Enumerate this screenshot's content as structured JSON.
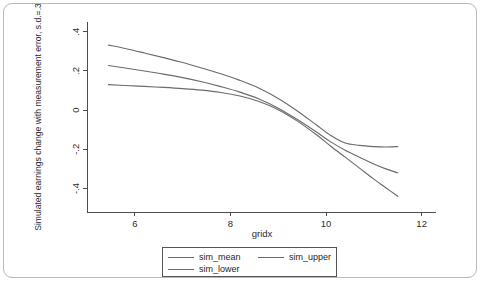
{
  "chart_data": {
    "type": "line",
    "title": "",
    "subtitle": "",
    "xlabel": "gridx",
    "ylabel": "Simulated earnings change with measurement error, s.d.=.3",
    "xlim": [
      5.0,
      12.3
    ],
    "ylim": [
      -0.52,
      0.45
    ],
    "grid": false,
    "legend_position": "bottom",
    "xticks": [
      "6",
      "8",
      "10",
      "12"
    ],
    "xtick_values": [
      6,
      8,
      10,
      12
    ],
    "yticks": [
      ".4",
      ".2",
      "0",
      "-.2",
      "-.4"
    ],
    "ytick_values": [
      0.4,
      0.2,
      0,
      -0.2,
      -0.4
    ],
    "x": [
      5.45,
      5.8,
      6.2,
      6.6,
      7.0,
      7.4,
      7.8,
      8.2,
      8.6,
      9.0,
      9.4,
      9.8,
      10.1,
      10.4,
      10.7,
      11.0,
      11.25,
      11.5
    ],
    "series": [
      {
        "name": "sim_mean",
        "color": "#6b6b6b",
        "values": [
          0.228,
          0.215,
          0.2,
          0.184,
          0.166,
          0.145,
          0.12,
          0.092,
          0.057,
          0.01,
          -0.048,
          -0.112,
          -0.162,
          -0.205,
          -0.24,
          -0.275,
          -0.3,
          -0.32
        ]
      },
      {
        "name": "sim_upper",
        "color": "#6b6b6b",
        "values": [
          0.332,
          0.315,
          0.292,
          0.268,
          0.243,
          0.215,
          0.186,
          0.152,
          0.112,
          0.06,
          -0.004,
          -0.076,
          -0.13,
          -0.168,
          -0.18,
          -0.186,
          -0.188,
          -0.186
        ]
      },
      {
        "name": "sim_lower",
        "color": "#6b6b6b",
        "values": [
          0.13,
          0.126,
          0.121,
          0.116,
          0.11,
          0.102,
          0.09,
          0.072,
          0.044,
          0.002,
          -0.056,
          -0.126,
          -0.184,
          -0.24,
          -0.296,
          -0.352,
          -0.396,
          -0.44
        ]
      }
    ]
  },
  "legend": {
    "items": [
      {
        "label": "sim_mean"
      },
      {
        "label": "sim_upper"
      },
      {
        "label": "sim_lower"
      }
    ]
  }
}
